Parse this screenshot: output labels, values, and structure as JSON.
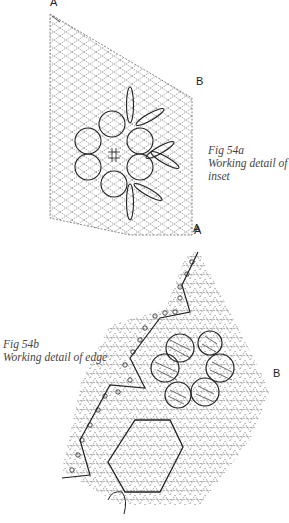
{
  "figure_a": {
    "corner_labels": {
      "top_left": "A",
      "right": "B",
      "bottom": "A"
    },
    "caption": {
      "number": "Fig 54a",
      "text_line1": "Working detail of",
      "text_line2": "inset"
    }
  },
  "figure_b": {
    "corner_labels": {
      "top": "A",
      "right": "B"
    },
    "caption": {
      "number": "Fig 54b",
      "text": "Working detail of edge"
    }
  },
  "colors": {
    "ink": "#222222",
    "grid": "#555555",
    "background": "#ffffff"
  }
}
